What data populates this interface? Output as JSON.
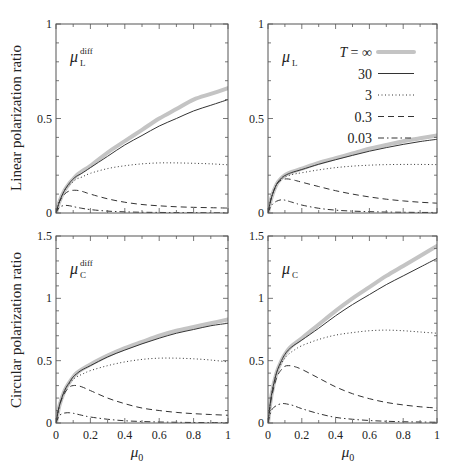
{
  "chart_data": [
    {
      "type": "line",
      "panel": "top-left",
      "label": "μ_L^diff",
      "label_main": "μ",
      "label_sub": "L",
      "label_sup": "diff",
      "xlabel": "",
      "ylabel": "Linear polarization ratio",
      "xlim": [
        0,
        1
      ],
      "ylim": [
        0,
        1
      ],
      "yticks": [
        0,
        0.5,
        1
      ],
      "ytick_labels": [
        "0",
        "0.5",
        "1"
      ],
      "xticks": [],
      "xtick_labels": [],
      "x": [
        0,
        0.02,
        0.05,
        0.08,
        0.1,
        0.12,
        0.15,
        0.2,
        0.3,
        0.4,
        0.5,
        0.6,
        0.7,
        0.8,
        0.9,
        1.0
      ],
      "series": [
        {
          "name": "T = ∞",
          "style": "thick-gray",
          "values": [
            0,
            0.06,
            0.12,
            0.16,
            0.18,
            0.2,
            0.22,
            0.25,
            0.32,
            0.38,
            0.44,
            0.5,
            0.55,
            0.6,
            0.63,
            0.66
          ]
        },
        {
          "name": "30",
          "style": "solid",
          "values": [
            0,
            0.06,
            0.12,
            0.16,
            0.18,
            0.195,
            0.21,
            0.24,
            0.3,
            0.36,
            0.41,
            0.46,
            0.5,
            0.54,
            0.57,
            0.6
          ]
        },
        {
          "name": "3",
          "style": "dotted",
          "values": [
            0,
            0.06,
            0.12,
            0.15,
            0.165,
            0.18,
            0.19,
            0.21,
            0.235,
            0.25,
            0.26,
            0.265,
            0.265,
            0.263,
            0.26,
            0.255
          ]
        },
        {
          "name": "0.3",
          "style": "dashed",
          "values": [
            0,
            0.06,
            0.1,
            0.118,
            0.12,
            0.12,
            0.115,
            0.1,
            0.075,
            0.057,
            0.045,
            0.038,
            0.033,
            0.03,
            0.028,
            0.026
          ]
        },
        {
          "name": "0.03",
          "style": "dashdot",
          "values": [
            0,
            0.03,
            0.04,
            0.038,
            0.034,
            0.03,
            0.025,
            0.018,
            0.01,
            0.006,
            0.004,
            0.003,
            0.002,
            0.002,
            0.001,
            0.001
          ]
        }
      ]
    },
    {
      "type": "line",
      "panel": "top-right",
      "label": "μ_L",
      "label_main": "μ",
      "label_sub": "L",
      "label_sup": "",
      "xlabel": "",
      "ylabel": "",
      "xlim": [
        0,
        1
      ],
      "ylim": [
        0,
        1
      ],
      "yticks": [
        0,
        0.5,
        1
      ],
      "ytick_labels": [
        "0",
        "0.5",
        "1"
      ],
      "xticks": [],
      "xtick_labels": [],
      "x": [
        0,
        0.02,
        0.05,
        0.08,
        0.1,
        0.12,
        0.15,
        0.2,
        0.3,
        0.4,
        0.5,
        0.6,
        0.7,
        0.8,
        0.9,
        1.0
      ],
      "series": [
        {
          "name": "T = ∞",
          "style": "thick-gray",
          "values": [
            0,
            0.08,
            0.15,
            0.185,
            0.2,
            0.21,
            0.22,
            0.235,
            0.265,
            0.29,
            0.315,
            0.34,
            0.36,
            0.38,
            0.395,
            0.41
          ]
        },
        {
          "name": "30",
          "style": "solid",
          "values": [
            0,
            0.08,
            0.15,
            0.185,
            0.198,
            0.207,
            0.217,
            0.23,
            0.258,
            0.282,
            0.305,
            0.327,
            0.346,
            0.363,
            0.378,
            0.39
          ]
        },
        {
          "name": "3",
          "style": "dotted",
          "values": [
            0,
            0.08,
            0.15,
            0.18,
            0.19,
            0.197,
            0.205,
            0.213,
            0.228,
            0.24,
            0.248,
            0.253,
            0.256,
            0.257,
            0.257,
            0.256
          ]
        },
        {
          "name": "0.3",
          "style": "dashed",
          "values": [
            0,
            0.08,
            0.15,
            0.175,
            0.18,
            0.18,
            0.175,
            0.163,
            0.14,
            0.118,
            0.1,
            0.085,
            0.073,
            0.064,
            0.057,
            0.052
          ]
        },
        {
          "name": "0.03",
          "style": "dashdot",
          "values": [
            0,
            0.04,
            0.062,
            0.07,
            0.068,
            0.063,
            0.055,
            0.042,
            0.025,
            0.015,
            0.01,
            0.007,
            0.005,
            0.004,
            0.003,
            0.003
          ]
        }
      ],
      "legend": {
        "position": "upper right",
        "title_symbol": "T",
        "entries": [
          "T = ∞",
          "30",
          "3",
          "0.3",
          "0.03"
        ]
      }
    },
    {
      "type": "line",
      "panel": "bottom-left",
      "label": "μ_C^diff",
      "label_main": "μ",
      "label_sub": "C",
      "label_sup": "diff",
      "xlabel": "μ0",
      "ylabel": "Circular polarization ratio",
      "xlim": [
        0,
        1
      ],
      "ylim": [
        0,
        1.5
      ],
      "yticks": [
        0,
        0.5,
        1,
        1.5
      ],
      "ytick_labels": [
        "0",
        "0.5",
        "1",
        "1.5"
      ],
      "xticks": [
        0,
        0.2,
        0.4,
        0.6,
        0.8,
        1
      ],
      "xtick_labels": [
        "0",
        "0.2",
        "0.4",
        "0.6",
        "0.8",
        "1"
      ],
      "x": [
        0,
        0.02,
        0.05,
        0.08,
        0.1,
        0.12,
        0.15,
        0.2,
        0.3,
        0.4,
        0.5,
        0.6,
        0.7,
        0.8,
        0.9,
        1.0
      ],
      "series": [
        {
          "name": "T = ∞",
          "style": "thick-gray",
          "values": [
            0,
            0.14,
            0.26,
            0.33,
            0.37,
            0.4,
            0.43,
            0.47,
            0.54,
            0.6,
            0.65,
            0.7,
            0.74,
            0.77,
            0.8,
            0.83
          ]
        },
        {
          "name": "30",
          "style": "solid",
          "values": [
            0,
            0.14,
            0.26,
            0.33,
            0.37,
            0.395,
            0.425,
            0.46,
            0.53,
            0.585,
            0.635,
            0.68,
            0.72,
            0.75,
            0.78,
            0.8
          ]
        },
        {
          "name": "3",
          "style": "dotted",
          "values": [
            0,
            0.14,
            0.26,
            0.32,
            0.35,
            0.37,
            0.39,
            0.42,
            0.46,
            0.49,
            0.51,
            0.52,
            0.52,
            0.515,
            0.505,
            0.49
          ]
        },
        {
          "name": "0.3",
          "style": "dashed",
          "values": [
            0,
            0.14,
            0.24,
            0.29,
            0.3,
            0.3,
            0.29,
            0.26,
            0.2,
            0.155,
            0.12,
            0.1,
            0.085,
            0.075,
            0.068,
            0.062
          ]
        },
        {
          "name": "0.03",
          "style": "dashdot",
          "values": [
            0,
            0.06,
            0.08,
            0.082,
            0.078,
            0.072,
            0.062,
            0.048,
            0.03,
            0.018,
            0.012,
            0.008,
            0.006,
            0.004,
            0.003,
            0.003
          ]
        }
      ]
    },
    {
      "type": "line",
      "panel": "bottom-right",
      "label": "μ_C",
      "label_main": "μ",
      "label_sub": "C",
      "label_sup": "",
      "xlabel": "μ0",
      "ylabel": "",
      "xlim": [
        0,
        1
      ],
      "ylim": [
        0,
        1.5
      ],
      "yticks": [
        0,
        0.5,
        1,
        1.5
      ],
      "ytick_labels": [
        "0",
        "0.5",
        "1",
        "1.5"
      ],
      "xticks": [
        0,
        0.2,
        0.4,
        0.6,
        0.8,
        1
      ],
      "xtick_labels": [
        "0",
        "0.2",
        "0.4",
        "0.6",
        "0.8",
        "1"
      ],
      "x": [
        0,
        0.02,
        0.05,
        0.08,
        0.1,
        0.12,
        0.15,
        0.2,
        0.3,
        0.4,
        0.5,
        0.6,
        0.7,
        0.8,
        0.9,
        1.0
      ],
      "series": [
        {
          "name": "T = ∞",
          "style": "thick-gray",
          "values": [
            0,
            0.22,
            0.4,
            0.5,
            0.55,
            0.59,
            0.63,
            0.68,
            0.79,
            0.9,
            1.0,
            1.09,
            1.18,
            1.26,
            1.34,
            1.42
          ]
        },
        {
          "name": "30",
          "style": "solid",
          "values": [
            0,
            0.22,
            0.4,
            0.5,
            0.55,
            0.585,
            0.62,
            0.665,
            0.76,
            0.86,
            0.95,
            1.03,
            1.11,
            1.18,
            1.25,
            1.32
          ]
        },
        {
          "name": "3",
          "style": "dotted",
          "values": [
            0,
            0.22,
            0.4,
            0.48,
            0.52,
            0.55,
            0.58,
            0.62,
            0.67,
            0.705,
            0.725,
            0.74,
            0.745,
            0.74,
            0.73,
            0.72
          ]
        },
        {
          "name": "0.3",
          "style": "dashed",
          "values": [
            0,
            0.2,
            0.36,
            0.43,
            0.455,
            0.46,
            0.455,
            0.43,
            0.36,
            0.29,
            0.235,
            0.195,
            0.165,
            0.145,
            0.13,
            0.12
          ]
        },
        {
          "name": "0.03",
          "style": "dashdot",
          "values": [
            0,
            0.1,
            0.14,
            0.155,
            0.155,
            0.15,
            0.14,
            0.115,
            0.075,
            0.045,
            0.03,
            0.02,
            0.014,
            0.01,
            0.008,
            0.006
          ]
        }
      ]
    }
  ],
  "axis_titles": {
    "top_ylabel": "Linear polarization ratio",
    "bottom_ylabel": "Circular polarization ratio",
    "xlabel_main": "μ",
    "xlabel_sub": "0"
  },
  "legend": {
    "symbol": "T",
    "entries": [
      {
        "label": "= ∞",
        "style": "thick-gray"
      },
      {
        "label": "30",
        "style": "solid"
      },
      {
        "label": "3",
        "style": "dotted"
      },
      {
        "label": "0.3",
        "style": "dashed"
      },
      {
        "label": "0.03",
        "style": "dashdot"
      }
    ]
  },
  "colors": {
    "thick_gray": "#c4c4c4",
    "line": "#333333",
    "frame": "#555555",
    "text": "#222222"
  }
}
